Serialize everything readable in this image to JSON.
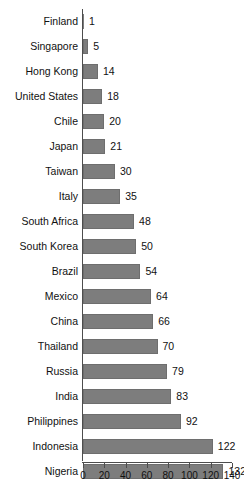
{
  "chart_data": {
    "type": "bar",
    "orientation": "horizontal",
    "title": "",
    "subtitle": "",
    "xlabel": "",
    "ylabel": "",
    "xlim": [
      0,
      140
    ],
    "xticks": [
      0,
      20,
      40,
      60,
      80,
      100,
      120,
      140
    ],
    "xtick_labels": [
      "0",
      "20",
      "40",
      "60",
      "80",
      "100",
      "120",
      "140"
    ],
    "grid": false,
    "legend": null,
    "bar_color": "#7d7d7d",
    "axis_color": "#4d4d4d",
    "text_color": "#111111",
    "show_value_labels": true,
    "categories": [
      "Finland",
      "Singapore",
      "Hong Kong",
      "United States",
      "Chile",
      "Japan",
      "Taiwan",
      "Italy",
      "South Africa",
      "South Korea",
      "Brazil",
      "Mexico",
      "China",
      "Thailand",
      "Russia",
      "India",
      "Philippines",
      "Indonesia",
      "Nigeria"
    ],
    "values": [
      1,
      5,
      14,
      18,
      20,
      21,
      30,
      35,
      48,
      50,
      54,
      64,
      66,
      70,
      79,
      83,
      92,
      122,
      132
    ],
    "value_labels": [
      "1",
      "5",
      "14",
      "18",
      "20",
      "21",
      "30",
      "35",
      "48",
      "50",
      "54",
      "64",
      "66",
      "70",
      "79",
      "83",
      "92",
      "122",
      "132"
    ]
  }
}
